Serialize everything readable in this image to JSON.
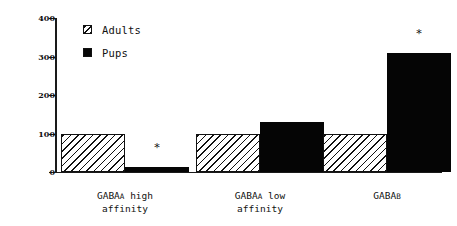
{
  "chart_data": {
    "type": "bar",
    "title": "",
    "xlabel": "",
    "ylabel": "",
    "ylim": [
      0,
      400
    ],
    "yticks": [
      0,
      100,
      200,
      300,
      400
    ],
    "grid": false,
    "legend_position": "top-left",
    "categories": [
      "GABAA high affinity",
      "GABAA low affinity",
      "GABAB"
    ],
    "category_lines": [
      [
        "GABA",
        "A",
        " high",
        "affinity"
      ],
      [
        "GABA",
        "A",
        " low",
        "affinity"
      ],
      [
        "GABA",
        "B",
        "",
        ""
      ]
    ],
    "series": [
      {
        "name": "Adults",
        "values": [
          100,
          100,
          100
        ],
        "fill": "hatched",
        "color": "#ffffff"
      },
      {
        "name": "Pups",
        "values": [
          13,
          130,
          310
        ],
        "fill": "solid",
        "color": "#050505"
      }
    ],
    "annotations": [
      {
        "text": "*",
        "series": "Pups",
        "category": "GABAA high affinity",
        "value": 13
      },
      {
        "text": "*",
        "series": "Pups",
        "category": "GABAB",
        "value": 310
      }
    ]
  },
  "legend": {
    "items": [
      {
        "label": "Adults",
        "swatch": "hatched-square-icon"
      },
      {
        "label": "Pups",
        "swatch": "solid-black-square-icon"
      }
    ]
  },
  "axis": {
    "y_tick_labels": [
      "400",
      "300",
      "200",
      "100",
      "0"
    ]
  }
}
